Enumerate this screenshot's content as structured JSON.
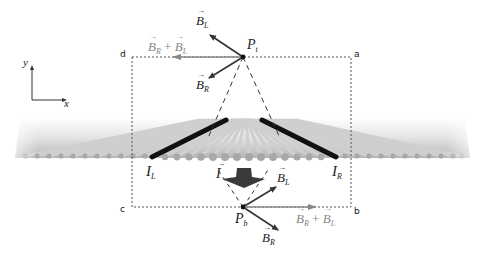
{
  "diagram": {
    "axes": {
      "x_label": "x",
      "y_label": "y"
    },
    "corners": {
      "a": "a",
      "b": "b",
      "c": "c",
      "d": "d"
    },
    "points": {
      "top": {
        "main": "P",
        "sub": "t"
      },
      "bottom": {
        "main": "P",
        "sub": "b"
      }
    },
    "currents": {
      "left": {
        "main": "I",
        "sub": "L"
      },
      "right": {
        "main": "I",
        "sub": "R"
      },
      "center": {
        "main": "I"
      }
    },
    "vectors_top": {
      "bl": {
        "main": "B",
        "sub": "L"
      },
      "br": {
        "main": "B",
        "sub": "R"
      },
      "sum_b1": "B",
      "sum_s1": "R",
      "plus": "+",
      "sum_b2": "B",
      "sum_s2": "L"
    },
    "vectors_bottom": {
      "bl": {
        "main": "B",
        "sub": "L"
      },
      "br": {
        "main": "B",
        "sub": "R"
      },
      "sum_b1": "B",
      "sum_s1": "R",
      "plus": "+",
      "sum_b2": "B",
      "sum_s2": "L"
    },
    "colors": {
      "vector_dark": "#333333",
      "vector_sum": "#888888",
      "wire_light": "#c8c8c8",
      "wire_highlight": "#111111",
      "dashed": "#555555"
    }
  }
}
